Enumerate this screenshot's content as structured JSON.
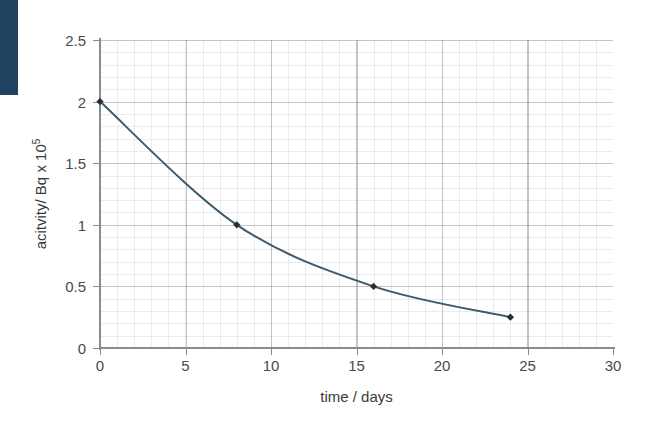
{
  "figure": {
    "corner_block_color": "#1e4260",
    "background_color": "#ffffff"
  },
  "chart_data": {
    "type": "line",
    "title": "",
    "subtitle": "",
    "xlabel": "time / days",
    "ylabel": "acitvity/ Bq x 10",
    "ylabel_superscript": "5",
    "xlim": [
      0,
      30
    ],
    "ylim": [
      0,
      2.5
    ],
    "xticks": [
      0,
      5,
      10,
      15,
      20,
      25,
      30
    ],
    "xtick_labels": [
      "0",
      "5",
      "10",
      "15",
      "20",
      "25",
      "30"
    ],
    "yticks": [
      0,
      0.5,
      1,
      1.5,
      2,
      2.5
    ],
    "ytick_labels": [
      "0",
      "0.5",
      "1",
      "1.5",
      "2",
      "2.5"
    ],
    "x_minor_step": 1,
    "y_minor_step": 0.1,
    "grid": true,
    "grid_major_color": "#8c8c96",
    "grid_minor_color": "#9696a0",
    "legend": null,
    "legend_position": "none",
    "line_color": "#3d5a6c",
    "marker_color": "#2b2b2b",
    "marker_shape": "diamond",
    "series": [
      {
        "name": "activity decay",
        "x": [
          0,
          8,
          16,
          24
        ],
        "values": [
          2,
          1,
          0.5,
          0.25
        ]
      }
    ],
    "annotations": []
  }
}
